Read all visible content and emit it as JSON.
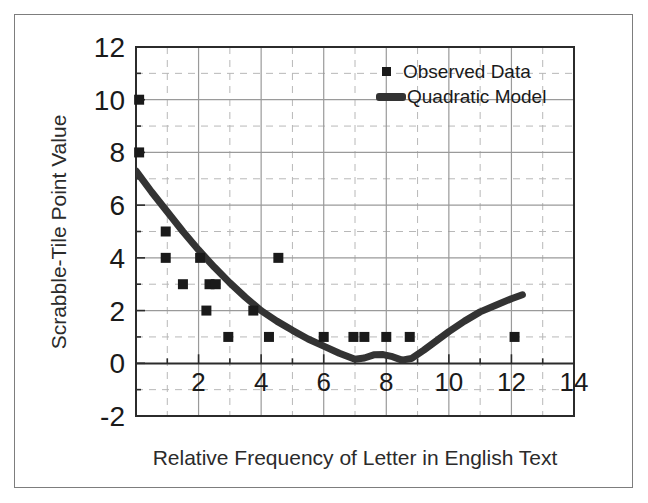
{
  "figure": {
    "frame_color": "#7d7d7d",
    "background": "#ffffff"
  },
  "chart_data": {
    "type": "scatter",
    "title": "",
    "xlabel": "Relative Frequency of Letter in English Text",
    "ylabel": "Scrabble-Tile Point Value",
    "xlim": [
      0,
      14
    ],
    "ylim": [
      -2,
      12
    ],
    "xticks": [
      2,
      4,
      6,
      8,
      10,
      12,
      14
    ],
    "xtick_labels": [
      "2",
      "4",
      "6",
      "8",
      "10",
      "12",
      "14"
    ],
    "yticks": [
      -2,
      0,
      2,
      4,
      6,
      8,
      10,
      12
    ],
    "ytick_labels": [
      "-2",
      "0",
      "2",
      "4",
      "6",
      "8",
      "10",
      "12"
    ],
    "grid": true,
    "grid_major_step": 2,
    "grid_minor_step": 1,
    "grid_major_color": "#9a9a9a",
    "grid_minor_color": "#b8b8b8",
    "axis_color": "#2b2b2b",
    "legend_position": "top-right",
    "series": [
      {
        "name": "Observed Data",
        "type": "scatter",
        "marker": "square",
        "color": "#1a1a1a",
        "points": [
          [
            0.1,
            10
          ],
          [
            0.1,
            8
          ],
          [
            0.95,
            5
          ],
          [
            0.95,
            4
          ],
          [
            1.5,
            3
          ],
          [
            2.05,
            4
          ],
          [
            2.35,
            3
          ],
          [
            2.55,
            3
          ],
          [
            2.25,
            2
          ],
          [
            2.95,
            1
          ],
          [
            3.75,
            2
          ],
          [
            4.25,
            1
          ],
          [
            4.55,
            4
          ],
          [
            6.0,
            1
          ],
          [
            6.95,
            1
          ],
          [
            7.3,
            1
          ],
          [
            8.0,
            1
          ],
          [
            8.75,
            1
          ],
          [
            12.1,
            1
          ]
        ]
      },
      {
        "name": "Quadratic Model",
        "type": "line",
        "color": "#333333",
        "linewidth": 7,
        "points": [
          [
            0.0,
            7.3
          ],
          [
            0.5,
            6.5
          ],
          [
            1.0,
            5.75
          ],
          [
            1.5,
            5.0
          ],
          [
            2.0,
            4.3
          ],
          [
            2.5,
            3.65
          ],
          [
            3.0,
            3.05
          ],
          [
            3.5,
            2.5
          ],
          [
            4.0,
            2.0
          ],
          [
            4.5,
            1.6
          ],
          [
            5.0,
            1.25
          ],
          [
            5.5,
            0.92
          ],
          [
            6.0,
            0.65
          ],
          [
            6.5,
            0.38
          ],
          [
            7.0,
            0.15
          ],
          [
            7.3,
            0.2
          ],
          [
            7.6,
            0.32
          ],
          [
            7.9,
            0.33
          ],
          [
            8.2,
            0.25
          ],
          [
            8.5,
            0.12
          ],
          [
            8.8,
            0.18
          ],
          [
            9.2,
            0.5
          ],
          [
            9.6,
            0.85
          ],
          [
            10.0,
            1.2
          ],
          [
            10.5,
            1.6
          ],
          [
            11.0,
            1.95
          ],
          [
            11.5,
            2.2
          ],
          [
            12.0,
            2.45
          ],
          [
            12.35,
            2.6
          ]
        ]
      }
    ],
    "legend": [
      {
        "label": "Observed Data",
        "marker": "square",
        "color": "#1a1a1a"
      },
      {
        "label": "Quadratic Model",
        "marker": "line",
        "color": "#333333"
      }
    ]
  }
}
